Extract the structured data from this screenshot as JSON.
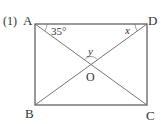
{
  "problem_number": "(1)",
  "vertices": {
    "A": {
      "label": "A",
      "x": 35,
      "y": 24
    },
    "D": {
      "label": "D",
      "x": 147,
      "y": 24
    },
    "B": {
      "label": "B",
      "x": 35,
      "y": 105
    },
    "C": {
      "label": "C",
      "x": 147,
      "y": 105
    },
    "O": {
      "label": "O",
      "x": 91,
      "y": 64.5
    }
  },
  "angles": {
    "at_A": "35°",
    "at_D": "x",
    "at_O": "y"
  },
  "colors": {
    "line": "#555555",
    "text": "#333333",
    "background": "#ffffff"
  }
}
